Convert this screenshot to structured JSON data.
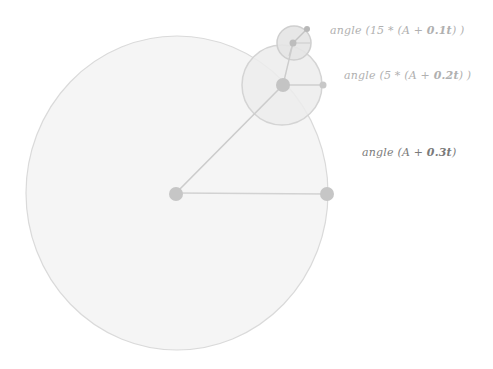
{
  "diagram": {
    "type": "epicycle-angles",
    "colors": {
      "background": "#ffffff",
      "circle_fill": "#f4f4f4",
      "circle_stroke": "#d6d6d6",
      "mid_circle_fill": "#ececec",
      "small_circle_fill": "#e6e6e6",
      "line": "#cccccc",
      "dot": "#c4c4c4",
      "label_light": "#b0b0b0",
      "label_dark": "#7a7a7a"
    },
    "circles": [
      {
        "name": "large",
        "cx": 177,
        "cy": 193,
        "rx": 151,
        "ry": 157
      },
      {
        "name": "medium",
        "cx": 282,
        "cy": 85,
        "r": 40
      },
      {
        "name": "small",
        "cx": 294,
        "cy": 42,
        "r": 17
      }
    ],
    "labels": [
      {
        "name": "small-circle-label",
        "prefix": "angle (15 * (A + ",
        "bold": "0.1t",
        "suffix": ") )"
      },
      {
        "name": "medium-circle-label",
        "prefix": "angle (5 * (A + ",
        "bold": "0.2t",
        "suffix": ") )"
      },
      {
        "name": "large-circle-label",
        "prefix": "angle (A + ",
        "bold": "0.3t",
        "suffix": ")"
      }
    ]
  }
}
